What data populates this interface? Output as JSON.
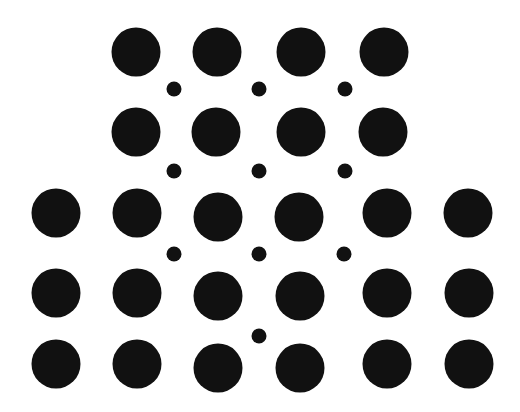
{
  "figure": {
    "background_color": "#ffffff",
    "dot_color": "#111111",
    "large_dot_diameter": 49,
    "small_dot_diameter": 15
  },
  "large_dots": [
    {
      "row": 1,
      "x": 136,
      "y": 52
    },
    {
      "row": 1,
      "x": 217,
      "y": 52
    },
    {
      "row": 1,
      "x": 301,
      "y": 52
    },
    {
      "row": 1,
      "x": 384,
      "y": 52
    },
    {
      "row": 2,
      "x": 136,
      "y": 132
    },
    {
      "row": 2,
      "x": 216,
      "y": 132
    },
    {
      "row": 2,
      "x": 301,
      "y": 132
    },
    {
      "row": 2,
      "x": 383,
      "y": 132
    },
    {
      "row": 3,
      "x": 56,
      "y": 213
    },
    {
      "row": 3,
      "x": 137,
      "y": 213
    },
    {
      "row": 3,
      "x": 218,
      "y": 217
    },
    {
      "row": 3,
      "x": 299,
      "y": 217
    },
    {
      "row": 3,
      "x": 387,
      "y": 213
    },
    {
      "row": 3,
      "x": 468,
      "y": 213
    },
    {
      "row": 4,
      "x": 56,
      "y": 293
    },
    {
      "row": 4,
      "x": 137,
      "y": 293
    },
    {
      "row": 4,
      "x": 218,
      "y": 296
    },
    {
      "row": 4,
      "x": 300,
      "y": 296
    },
    {
      "row": 4,
      "x": 387,
      "y": 293
    },
    {
      "row": 4,
      "x": 469,
      "y": 293
    },
    {
      "row": 5,
      "x": 56,
      "y": 364
    },
    {
      "row": 5,
      "x": 137,
      "y": 364
    },
    {
      "row": 5,
      "x": 218,
      "y": 368
    },
    {
      "row": 5,
      "x": 300,
      "y": 368
    },
    {
      "row": 5,
      "x": 387,
      "y": 364
    },
    {
      "row": 5,
      "x": 469,
      "y": 364
    }
  ],
  "small_dots": [
    {
      "x": 174,
      "y": 89
    },
    {
      "x": 259,
      "y": 89
    },
    {
      "x": 345,
      "y": 89
    },
    {
      "x": 174,
      "y": 171
    },
    {
      "x": 259,
      "y": 171
    },
    {
      "x": 345,
      "y": 171
    },
    {
      "x": 174,
      "y": 254
    },
    {
      "x": 259,
      "y": 254
    },
    {
      "x": 344,
      "y": 254
    },
    {
      "x": 259,
      "y": 336
    }
  ]
}
